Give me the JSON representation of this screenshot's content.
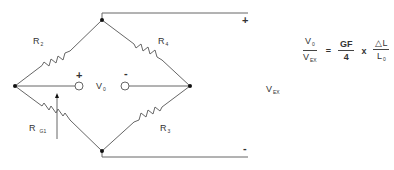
{
  "diagram": {
    "resistors": {
      "top_left": {
        "symbol": "R",
        "subscript": "2"
      },
      "top_right": {
        "symbol": "R",
        "subscript": "4"
      },
      "bottom_right": {
        "symbol": "R",
        "subscript": "3"
      },
      "bottom_left": {
        "symbol": "R",
        "subscript": "G1"
      }
    },
    "output": {
      "symbol": "V",
      "subscript": "0",
      "plus": "+",
      "minus": "-"
    },
    "excitation": {
      "symbol": "V",
      "subscript": "EX",
      "plus": "+",
      "minus": "-"
    },
    "formula": {
      "lhs_num": "V",
      "lhs_num_sub": "0",
      "lhs_den": "V",
      "lhs_den_sub": "EX",
      "equals": "=",
      "mid_num": "GF",
      "mid_den": "4",
      "times": "x",
      "rhs_num": "△L",
      "rhs_den": "L",
      "rhs_den_sub": "0"
    },
    "colors": {
      "line": "#555555",
      "node": "#111111",
      "text": "#333333"
    }
  }
}
